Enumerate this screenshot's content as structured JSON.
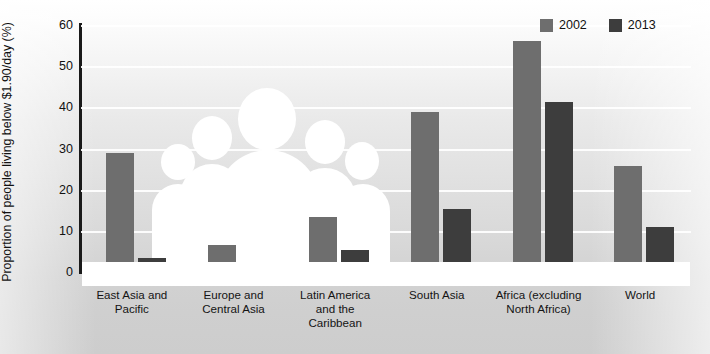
{
  "chart_data": {
    "type": "bar",
    "title": "",
    "xlabel": "",
    "ylabel": "Proportion of people living below $1.90/day (%)",
    "ylim": [
      0,
      60
    ],
    "yticks": [
      0,
      10,
      20,
      30,
      40,
      50,
      60
    ],
    "grid": true,
    "legend_position": "top-right",
    "categories": [
      "East Asia and\nPacific",
      "Europe and\nCentral Asia",
      "Latin America\nand the\nCaribbean",
      "South Asia",
      "Africa (excluding\nNorth Africa)",
      "World"
    ],
    "series": [
      {
        "name": "2002",
        "color": "#6e6e6e",
        "values": [
          29.0,
          6.5,
          13.4,
          38.8,
          56.2,
          25.7
        ]
      },
      {
        "name": "2013",
        "color": "#3d3d3d",
        "values": [
          3.3,
          2.0,
          5.4,
          15.3,
          41.2,
          11.0
        ]
      }
    ]
  },
  "legend": {
    "items": [
      {
        "label": "2002",
        "color": "#6e6e6e"
      },
      {
        "label": "2013",
        "color": "#3d3d3d"
      }
    ]
  },
  "axis": {
    "y_title": "Proportion of people living below $1.90/day (%)",
    "y_ticks": [
      "0",
      "10",
      "20",
      "30",
      "40",
      "50",
      "60"
    ]
  }
}
